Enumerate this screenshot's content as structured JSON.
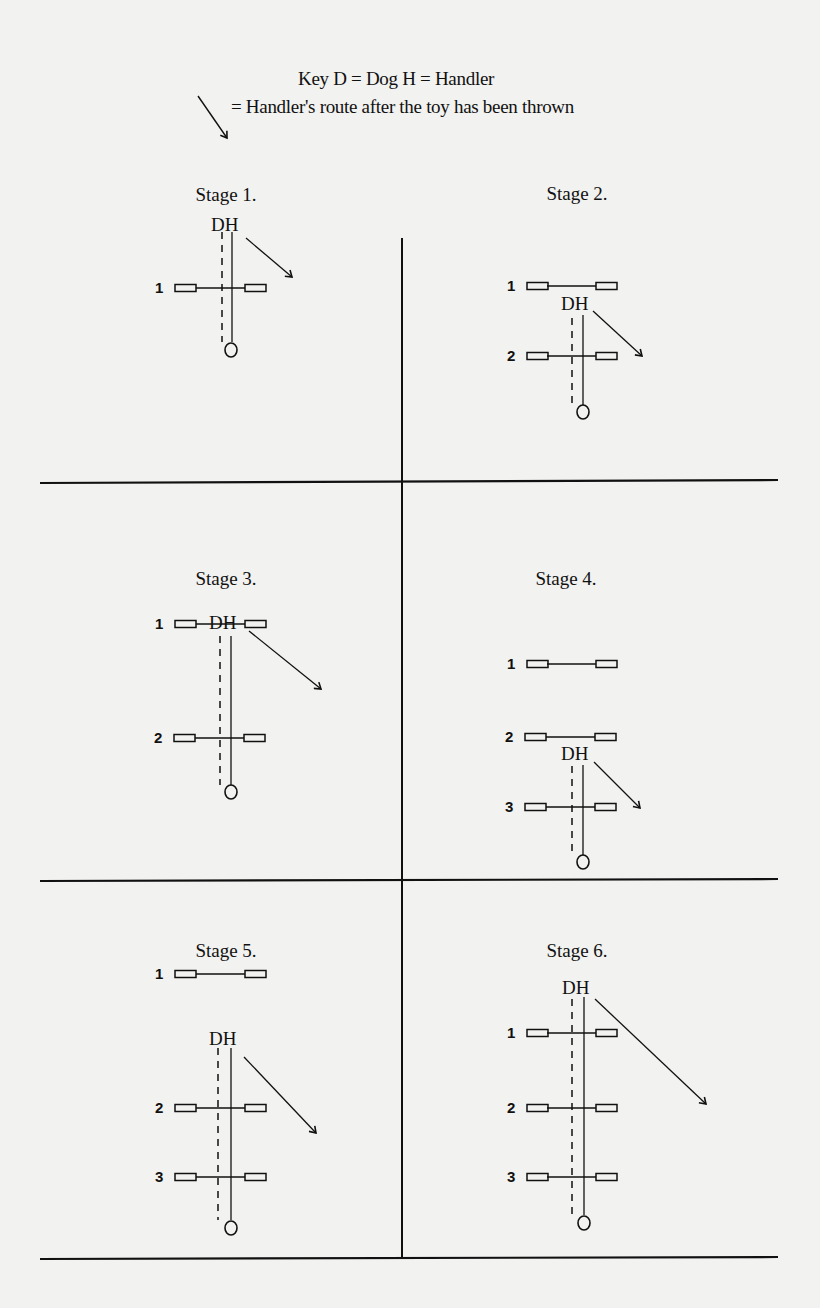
{
  "key": {
    "line1": "Key D = Dog  H = Handler",
    "line2": "= Handler's route after  the toy has been thrown"
  },
  "stages": [
    {
      "title": "Stage 1.",
      "jumps": [
        "1"
      ],
      "dh_label": "DH"
    },
    {
      "title": "Stage 2.",
      "jumps": [
        "1",
        "2"
      ],
      "dh_label": "DH"
    },
    {
      "title": "Stage 3.",
      "jumps": [
        "1",
        "2"
      ],
      "dh_label": "DH"
    },
    {
      "title": "Stage 4.",
      "jumps": [
        "1",
        "2",
        "3"
      ],
      "dh_label": "DH"
    },
    {
      "title": "Stage 5.",
      "jumps": [
        "1",
        "2",
        "3"
      ],
      "dh_label": "DH"
    },
    {
      "title": "Stage 6.",
      "jumps": [
        "1",
        "2",
        "3"
      ],
      "dh_label": "DH"
    }
  ],
  "colors": {
    "ink": "#111111",
    "paper": "#f2f2f0"
  }
}
